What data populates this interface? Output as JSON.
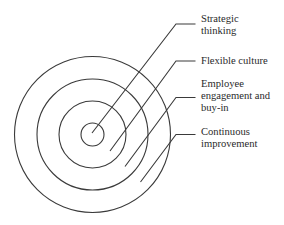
{
  "diagram": {
    "type": "concentric-circles",
    "colors": {
      "background": "#ffffff",
      "stroke": "#3a3a3a",
      "text": "#2a2a2a"
    },
    "center": [
      92.5,
      134.5
    ],
    "circles": [
      {
        "radius": 11.5
      },
      {
        "radius": 33.5
      },
      {
        "radius": 55.5
      },
      {
        "radius": 78
      }
    ],
    "labels": [
      {
        "id": "strategic-thinking",
        "lines": [
          "Strategic",
          "thinking"
        ],
        "leader": {
          "end": [
            92,
            133
          ],
          "elbow": [
            176,
            24
          ],
          "start": [
            195.5,
            24
          ]
        },
        "top": 13
      },
      {
        "id": "flexible-culture",
        "lines": [
          "Flexible culture"
        ],
        "leader": {
          "end": [
            110,
            151
          ],
          "elbow": [
            176,
            61
          ],
          "start": [
            195.5,
            61
          ]
        },
        "top": 55
      },
      {
        "id": "employee-engagement",
        "lines": [
          "Employee",
          "engagement and",
          "buy-in"
        ],
        "leader": {
          "end": [
            125,
            166.5
          ],
          "elbow": [
            176,
            97.5
          ],
          "start": [
            195.5,
            97.5
          ]
        },
        "top": 78
      },
      {
        "id": "continuous-improvement",
        "lines": [
          "Continuous",
          "improvement"
        ],
        "leader": {
          "end": [
            140.5,
            182
          ],
          "elbow": [
            176,
            134.5
          ],
          "start": [
            195.5,
            134.5
          ]
        },
        "top": 126
      }
    ]
  }
}
